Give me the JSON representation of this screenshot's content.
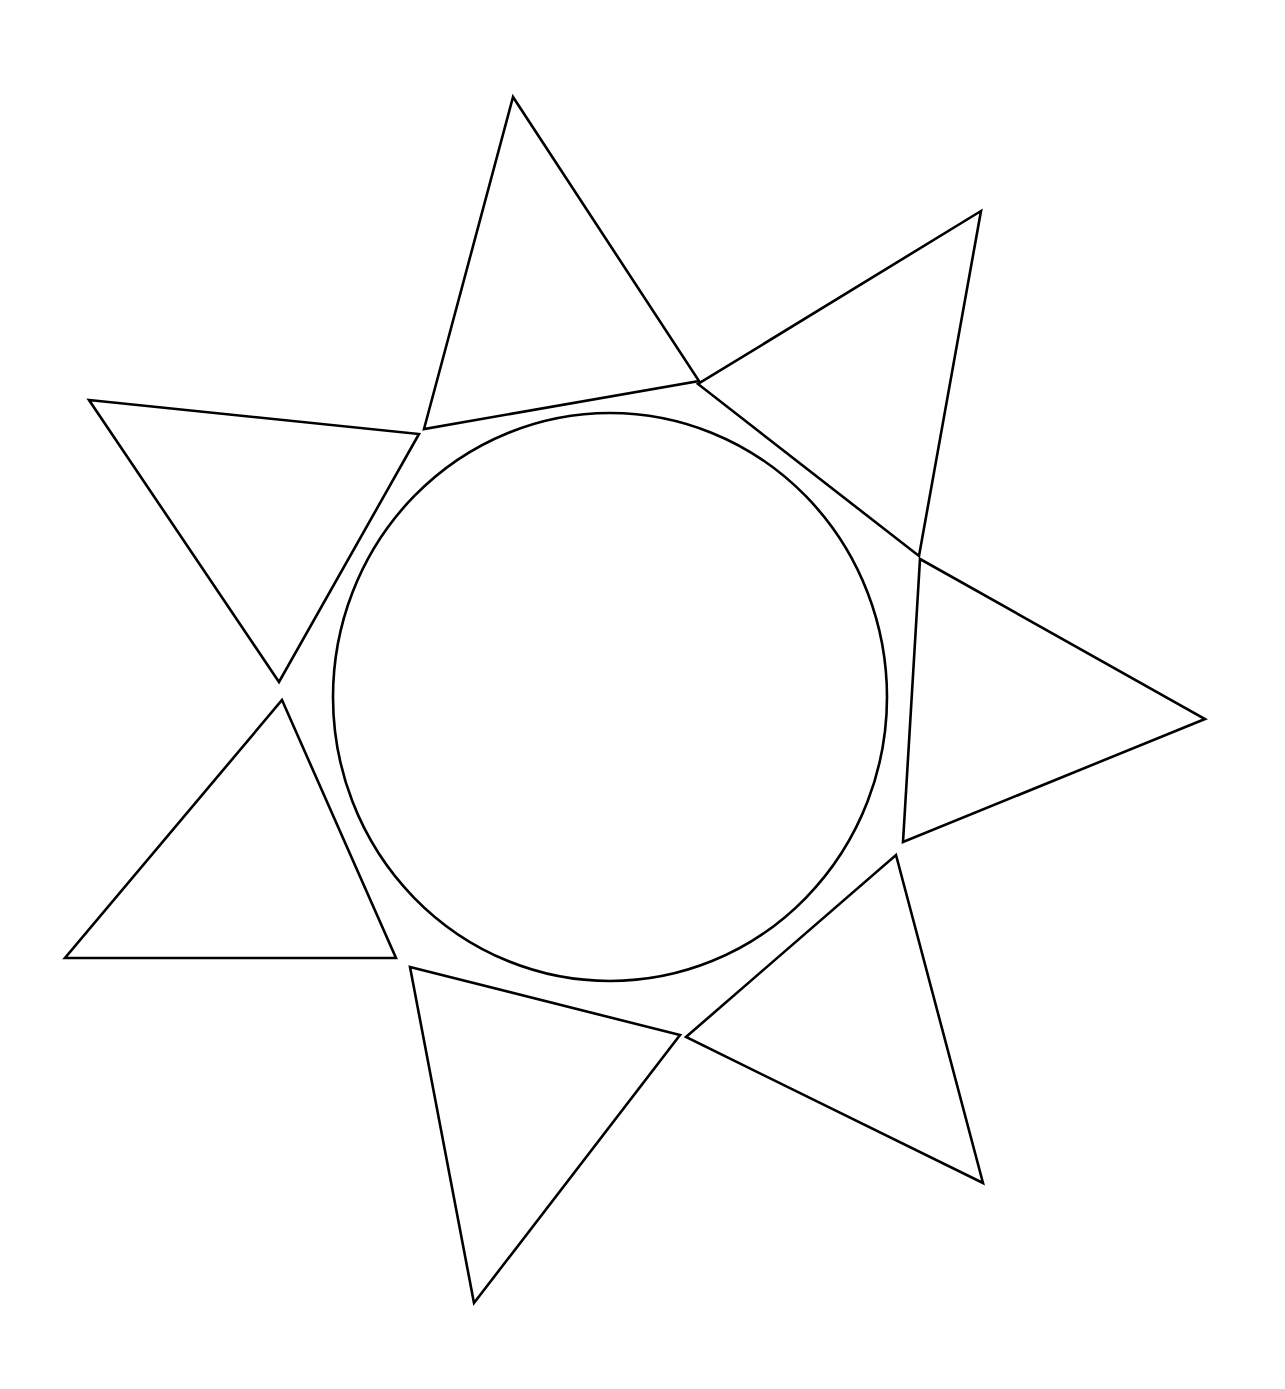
{
  "document": {
    "title": "Geometric Line Figure",
    "background_color": "#ffffff",
    "width": 1285,
    "height": 1389
  },
  "style": {
    "stroke_color": "#000000",
    "stroke_width": 2.6,
    "fill": "none"
  },
  "chart_data": {
    "type": "diagram",
    "title": "",
    "subtitle": "",
    "xlabel": "",
    "ylabel": "",
    "grid": false,
    "legend": null,
    "annotations": [],
    "canvas": {
      "width": 1285,
      "height": 1389
    },
    "circle": {
      "name": "central-circle",
      "cx": 610,
      "cy": 697,
      "r": 277,
      "rx": 277,
      "ry": 284
    },
    "triangles": [
      {
        "name": "top-triangle",
        "points": [
          [
            513,
            97
          ],
          [
            424,
            429
          ],
          [
            699,
            381
          ]
        ]
      },
      {
        "name": "upper-right-triangle",
        "points": [
          [
            981,
            211
          ],
          [
            698,
            384
          ],
          [
            919,
            556
          ]
        ]
      },
      {
        "name": "right-triangle",
        "points": [
          [
            920,
            559
          ],
          [
            1205,
            719
          ],
          [
            903,
            842
          ]
        ]
      },
      {
        "name": "lower-right-triangle",
        "points": [
          [
            896,
            855
          ],
          [
            983,
            1183
          ],
          [
            686,
            1037
          ]
        ]
      },
      {
        "name": "bottom-triangle",
        "points": [
          [
            410,
            967
          ],
          [
            680,
            1035
          ],
          [
            474,
            1303
          ]
        ]
      },
      {
        "name": "lower-left-triangle",
        "points": [
          [
            282,
            700
          ],
          [
            396,
            958
          ],
          [
            65,
            958
          ]
        ]
      },
      {
        "name": "upper-left-triangle",
        "points": [
          [
            89,
            400
          ],
          [
            419,
            434
          ],
          [
            279,
            682
          ]
        ]
      }
    ]
  }
}
